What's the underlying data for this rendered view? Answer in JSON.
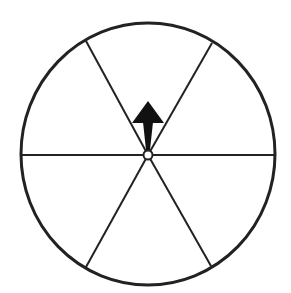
{
  "diagram": {
    "sections": 6,
    "pointer_direction": "up",
    "colors": {
      "stroke": "#222222",
      "fill": "#ffffff",
      "arrow": "#111111"
    },
    "geometry": {
      "center": [
        148,
        155
      ],
      "radius_x": 127,
      "radius_y": 131,
      "spoke_endpoints": [
        [
          21,
          155
        ],
        [
          275,
          155
        ],
        [
          86,
          41
        ],
        [
          212,
          43
        ],
        [
          86,
          267
        ],
        [
          211,
          266
        ]
      ],
      "arrow_tip": [
        148,
        101
      ],
      "arrow_head_base_y": 122,
      "arrow_head_half_width": 16
    }
  }
}
